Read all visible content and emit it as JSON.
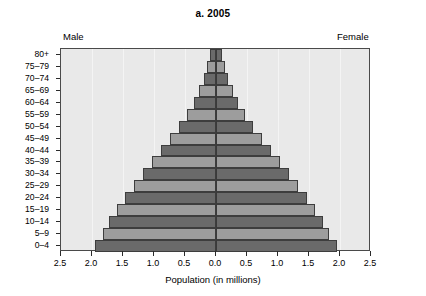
{
  "chart_data": {
    "type": "bar",
    "subtype": "population-pyramid",
    "title": "a. 2005",
    "xlabel": "Population (in millions)",
    "ylabel": "",
    "left_label": "Male",
    "right_label": "Female",
    "xlim": [
      -2.5,
      2.5
    ],
    "xticks": [
      2.5,
      2.0,
      1.5,
      1.0,
      0.5,
      0.0,
      0.5,
      1.0,
      1.5,
      2.0,
      2.5
    ],
    "grid": true,
    "legend": "none",
    "categories": [
      "80+",
      "75–79",
      "70–74",
      "65–69",
      "60–64",
      "55–59",
      "50–54",
      "45–49",
      "40–44",
      "35–39",
      "30–34",
      "25–29",
      "20–24",
      "15–19",
      "10–14",
      "5–9",
      "0–4"
    ],
    "series": [
      {
        "name": "Male",
        "side": "left",
        "values": [
          0.1,
          0.14,
          0.2,
          0.27,
          0.36,
          0.47,
          0.6,
          0.74,
          0.88,
          1.03,
          1.18,
          1.33,
          1.47,
          1.6,
          1.72,
          1.82,
          1.95
        ]
      },
      {
        "name": "Female",
        "side": "right",
        "values": [
          0.1,
          0.14,
          0.2,
          0.27,
          0.36,
          0.47,
          0.6,
          0.74,
          0.88,
          1.03,
          1.18,
          1.33,
          1.47,
          1.6,
          1.72,
          1.82,
          1.95
        ]
      }
    ],
    "colors": {
      "bar_dark": "#6a6a6a",
      "bar_light": "#9d9d9d",
      "plot_background": "#e9e9e9",
      "axis": "#3a3a3a"
    }
  }
}
